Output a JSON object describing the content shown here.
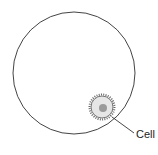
{
  "diagram": {
    "outer_circle": {
      "cx": 74,
      "cy": 73,
      "r": 61,
      "stroke": "#444444"
    },
    "cell": {
      "cx": 102,
      "cy": 107,
      "r": 11,
      "fill": "#e4e4e4",
      "stroke": "#555555",
      "spiky_edge": true
    },
    "nucleus": {
      "cx": 103,
      "cy": 108,
      "r": 4,
      "fill": "#9a9a9a"
    },
    "leader_line": {
      "x1": 112,
      "y1": 117,
      "x2": 134,
      "y2": 133
    },
    "labels": {
      "cell": "Cell"
    }
  }
}
